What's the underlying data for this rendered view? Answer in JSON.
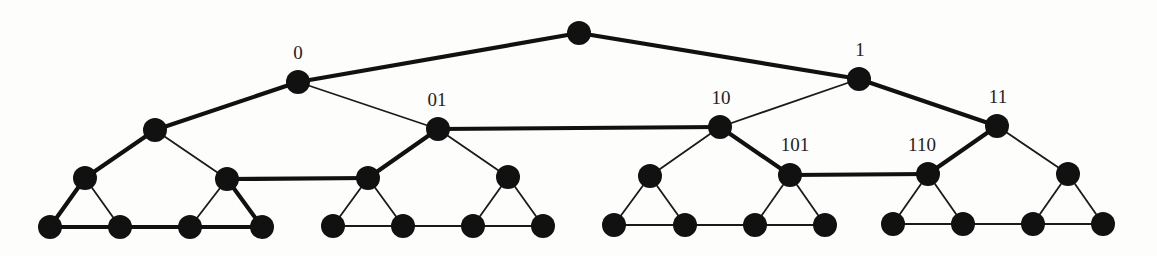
{
  "diagram": {
    "type": "binary-tree-with-level-links",
    "node_radius": 12,
    "nodes": [
      {
        "id": "r",
        "x": 579,
        "y": 33,
        "label": ""
      },
      {
        "id": "0",
        "x": 298,
        "y": 82,
        "label": "0"
      },
      {
        "id": "1",
        "x": 859,
        "y": 79,
        "label": "1"
      },
      {
        "id": "00",
        "x": 155,
        "y": 130,
        "label": ""
      },
      {
        "id": "01",
        "x": 438,
        "y": 129,
        "label": "01"
      },
      {
        "id": "10",
        "x": 720,
        "y": 127,
        "label": "10"
      },
      {
        "id": "11",
        "x": 997,
        "y": 126,
        "label": "11"
      },
      {
        "id": "000",
        "x": 85,
        "y": 178,
        "label": ""
      },
      {
        "id": "001",
        "x": 227,
        "y": 179,
        "label": ""
      },
      {
        "id": "010",
        "x": 368,
        "y": 178,
        "label": ""
      },
      {
        "id": "011",
        "x": 508,
        "y": 177,
        "label": ""
      },
      {
        "id": "100",
        "x": 650,
        "y": 176,
        "label": ""
      },
      {
        "id": "101",
        "x": 790,
        "y": 175,
        "label": "101"
      },
      {
        "id": "110",
        "x": 928,
        "y": 174,
        "label": "110"
      },
      {
        "id": "111",
        "x": 1068,
        "y": 174,
        "label": ""
      },
      {
        "id": "L0",
        "x": 50,
        "y": 227,
        "label": ""
      },
      {
        "id": "L1",
        "x": 120,
        "y": 227,
        "label": ""
      },
      {
        "id": "L2",
        "x": 190,
        "y": 227,
        "label": ""
      },
      {
        "id": "L3",
        "x": 262,
        "y": 227,
        "label": ""
      },
      {
        "id": "L4",
        "x": 333,
        "y": 226,
        "label": ""
      },
      {
        "id": "L5",
        "x": 403,
        "y": 226,
        "label": ""
      },
      {
        "id": "L6",
        "x": 473,
        "y": 226,
        "label": ""
      },
      {
        "id": "L7",
        "x": 543,
        "y": 226,
        "label": ""
      },
      {
        "id": "L8",
        "x": 614,
        "y": 225,
        "label": ""
      },
      {
        "id": "L9",
        "x": 685,
        "y": 225,
        "label": ""
      },
      {
        "id": "L10",
        "x": 755,
        "y": 225,
        "label": ""
      },
      {
        "id": "L11",
        "x": 825,
        "y": 225,
        "label": ""
      },
      {
        "id": "L12",
        "x": 893,
        "y": 224,
        "label": ""
      },
      {
        "id": "L13",
        "x": 963,
        "y": 224,
        "label": ""
      },
      {
        "id": "L14",
        "x": 1033,
        "y": 224,
        "label": ""
      },
      {
        "id": "L15",
        "x": 1103,
        "y": 224,
        "label": ""
      }
    ],
    "labels": [
      {
        "text": "0",
        "x": 298,
        "y": 59
      },
      {
        "text": "1",
        "x": 860,
        "y": 56
      },
      {
        "text": "01",
        "x": 437,
        "y": 106
      },
      {
        "text": "10",
        "x": 721,
        "y": 104
      },
      {
        "text": "11",
        "x": 998,
        "y": 103
      },
      {
        "text": "101",
        "x": 795,
        "y": 151
      },
      {
        "text": "110",
        "x": 922,
        "y": 151
      }
    ],
    "edges": [
      {
        "from": "r",
        "to": "0",
        "weight": "thick"
      },
      {
        "from": "r",
        "to": "1",
        "weight": "thick"
      },
      {
        "from": "0",
        "to": "00",
        "weight": "thick"
      },
      {
        "from": "0",
        "to": "01",
        "weight": "thin"
      },
      {
        "from": "1",
        "to": "10",
        "weight": "thin"
      },
      {
        "from": "1",
        "to": "11",
        "weight": "thick"
      },
      {
        "from": "01",
        "to": "10",
        "weight": "thick"
      },
      {
        "from": "00",
        "to": "000",
        "weight": "thick"
      },
      {
        "from": "00",
        "to": "001",
        "weight": "thin"
      },
      {
        "from": "01",
        "to": "010",
        "weight": "thick"
      },
      {
        "from": "01",
        "to": "011",
        "weight": "thin"
      },
      {
        "from": "10",
        "to": "100",
        "weight": "thin"
      },
      {
        "from": "10",
        "to": "101",
        "weight": "thick"
      },
      {
        "from": "11",
        "to": "110",
        "weight": "thick"
      },
      {
        "from": "11",
        "to": "111",
        "weight": "thin"
      },
      {
        "from": "001",
        "to": "010",
        "weight": "thick"
      },
      {
        "from": "101",
        "to": "110",
        "weight": "thick"
      },
      {
        "from": "000",
        "to": "L0",
        "weight": "thick"
      },
      {
        "from": "000",
        "to": "L1",
        "weight": "thin"
      },
      {
        "from": "001",
        "to": "L2",
        "weight": "thin"
      },
      {
        "from": "001",
        "to": "L3",
        "weight": "thick"
      },
      {
        "from": "010",
        "to": "L4",
        "weight": "thin"
      },
      {
        "from": "010",
        "to": "L5",
        "weight": "thin"
      },
      {
        "from": "011",
        "to": "L6",
        "weight": "thin"
      },
      {
        "from": "011",
        "to": "L7",
        "weight": "thin"
      },
      {
        "from": "100",
        "to": "L8",
        "weight": "thin"
      },
      {
        "from": "100",
        "to": "L9",
        "weight": "thin"
      },
      {
        "from": "101",
        "to": "L10",
        "weight": "thin"
      },
      {
        "from": "101",
        "to": "L11",
        "weight": "thin"
      },
      {
        "from": "110",
        "to": "L12",
        "weight": "thin"
      },
      {
        "from": "110",
        "to": "L13",
        "weight": "thin"
      },
      {
        "from": "111",
        "to": "L14",
        "weight": "thin"
      },
      {
        "from": "111",
        "to": "L15",
        "weight": "thin"
      },
      {
        "from": "L0",
        "to": "L1",
        "weight": "thick"
      },
      {
        "from": "L1",
        "to": "L2",
        "weight": "thick"
      },
      {
        "from": "L2",
        "to": "L3",
        "weight": "thick"
      },
      {
        "from": "L4",
        "to": "L5",
        "weight": "thin"
      },
      {
        "from": "L5",
        "to": "L6",
        "weight": "thin"
      },
      {
        "from": "L6",
        "to": "L7",
        "weight": "thin"
      },
      {
        "from": "L8",
        "to": "L9",
        "weight": "thin"
      },
      {
        "from": "L9",
        "to": "L10",
        "weight": "thin"
      },
      {
        "from": "L10",
        "to": "L11",
        "weight": "thin"
      },
      {
        "from": "L12",
        "to": "L13",
        "weight": "thin"
      },
      {
        "from": "L13",
        "to": "L14",
        "weight": "thin"
      },
      {
        "from": "L14",
        "to": "L15",
        "weight": "thin"
      }
    ]
  }
}
